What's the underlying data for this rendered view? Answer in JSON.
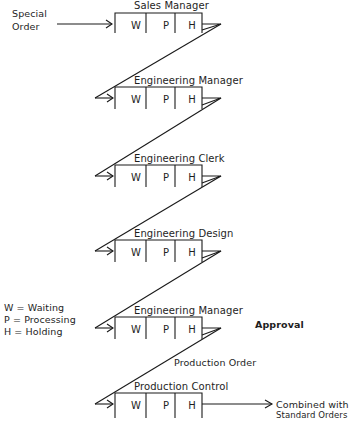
{
  "diagram": {
    "source_label": [
      "Special",
      "Order"
    ],
    "stations": [
      {
        "title": "Sales Manager",
        "cells": [
          "W",
          "P",
          "H"
        ]
      },
      {
        "title": "Engineering Manager",
        "cells": [
          "W",
          "P",
          "H"
        ]
      },
      {
        "title": "Engineering Clerk",
        "cells": [
          "W",
          "P",
          "H"
        ]
      },
      {
        "title": "Engineering Design",
        "cells": [
          "W",
          "P",
          "H"
        ]
      },
      {
        "title": "Engineering Manager",
        "cells": [
          "W",
          "P",
          "H"
        ]
      },
      {
        "title": "Production Control",
        "cells": [
          "W",
          "P",
          "H"
        ]
      }
    ],
    "legend": [
      "W = Waiting",
      "P  = Processing",
      "H = Holding"
    ],
    "annotations": {
      "approval": "Approval",
      "production_order": "Production Order"
    },
    "output_label": [
      "Combined with",
      "Standard Orders"
    ],
    "line_color": "#1a1a1a"
  }
}
